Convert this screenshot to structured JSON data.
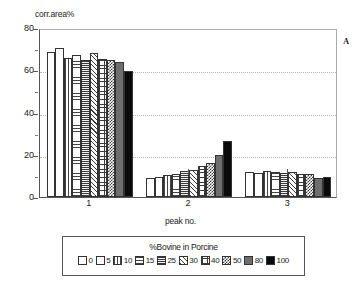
{
  "chart_data": {
    "type": "bar",
    "title": "",
    "panel_letter": "A",
    "ylabel": "corr.area%",
    "xlabel": "peak no.",
    "categories": [
      "1",
      "2",
      "3"
    ],
    "ylim": [
      0,
      80
    ],
    "yticks": [
      0,
      20,
      40,
      60,
      80
    ],
    "grid": true,
    "legend_title": "%Bovine in Porcine",
    "legend_position": "bottom",
    "series": [
      {
        "name": "0",
        "pattern": "open-white",
        "values": [
          68.5,
          9.0,
          12.0
        ]
      },
      {
        "name": "5",
        "pattern": "fine-dots",
        "values": [
          70.5,
          9.5,
          11.5
        ]
      },
      {
        "name": "10",
        "pattern": "vertical-lines",
        "values": [
          66.0,
          10.5,
          12.5
        ]
      },
      {
        "name": "15",
        "pattern": "horizontal-lines",
        "values": [
          67.0,
          11.0,
          12.0
        ]
      },
      {
        "name": "25",
        "pattern": "dense-horizontal",
        "values": [
          65.0,
          12.5,
          11.5
        ]
      },
      {
        "name": "30",
        "pattern": "diagonal-hatch",
        "values": [
          68.0,
          13.0,
          12.0
        ]
      },
      {
        "name": "40",
        "pattern": "grid-crosshatch",
        "values": [
          65.5,
          14.5,
          11.0
        ]
      },
      {
        "name": "50",
        "pattern": "checkerboard",
        "values": [
          65.0,
          16.0,
          11.0
        ]
      },
      {
        "name": "80",
        "pattern": "dark-gray-solid",
        "values": [
          64.0,
          20.0,
          9.0
        ]
      },
      {
        "name": "100",
        "pattern": "black-solid",
        "values": [
          59.5,
          26.5,
          9.5
        ]
      }
    ]
  }
}
